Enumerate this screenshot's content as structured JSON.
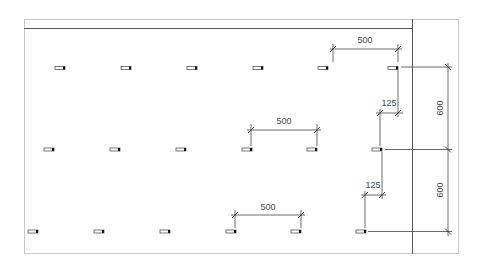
{
  "drawing": {
    "title": "Fixture layout plan",
    "colors": {
      "line": "#444444",
      "frame": "#c8c8c8",
      "background": "#ffffff"
    },
    "rows": [
      {
        "y": 68,
        "marks_x": [
          60,
          126,
          192,
          258,
          323,
          388
        ]
      },
      {
        "y": 149,
        "marks_x": [
          44,
          110,
          176,
          242,
          308,
          373
        ]
      },
      {
        "y": 231,
        "marks_x": [
          28,
          94,
          160,
          226,
          291,
          357
        ]
      }
    ],
    "dimensions": {
      "top_spacing": {
        "label": "500"
      },
      "middle_spacing": {
        "label": "500"
      },
      "bottom_spacing": {
        "label": "500"
      },
      "upper_offset": {
        "label": "125"
      },
      "lower_offset": {
        "label": "125"
      },
      "upper_row_gap": {
        "label": "600"
      },
      "lower_row_gap": {
        "label": "600"
      }
    }
  }
}
